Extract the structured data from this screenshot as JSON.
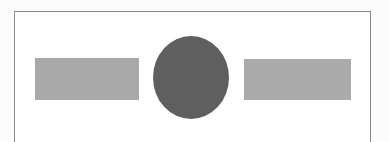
{
  "diagram": {
    "frame": {
      "border_color": "#8a8a8a",
      "background": "#ffffff"
    },
    "shapes": [
      {
        "id": "left-rectangle",
        "type": "rectangle",
        "color": "#a9a9a9"
      },
      {
        "id": "center-circle",
        "type": "circle",
        "color": "#5f5f5f"
      },
      {
        "id": "right-rectangle",
        "type": "rectangle",
        "color": "#ababab"
      }
    ]
  }
}
